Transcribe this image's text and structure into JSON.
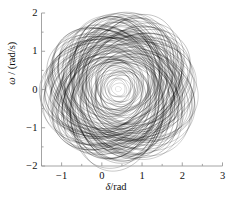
{
  "chart_data": {
    "type": "line",
    "title": "",
    "subtitle": "",
    "xlabel": "δ/rad",
    "ylabel": "ω / (rad/s)",
    "xlabel_symbol": "δ",
    "xlabel_unit": "/rad",
    "ylabel_symbol": "ω",
    "ylabel_unit": " / (rad/s)",
    "xlim": [
      -1.5,
      3.0
    ],
    "ylim": [
      -2.0,
      2.0
    ],
    "xticks": [
      -1,
      0,
      1,
      2,
      3
    ],
    "xtick_labels": [
      "-1",
      "0",
      "1",
      "2",
      "3"
    ],
    "yticks": [
      -2,
      -1,
      0,
      1,
      2
    ],
    "ytick_labels": [
      "-2",
      "-1",
      "0",
      "1",
      "2"
    ],
    "x_minor_tick_step": 0.5,
    "y_minor_tick_step": 0.5,
    "grid": false,
    "legend": null,
    "legend_position": "none",
    "spines": [
      "left",
      "bottom"
    ],
    "line_color": "#000000",
    "background_color": "#ffffff",
    "axis_color": "#9a9a9a",
    "attractor": {
      "center_x": 0.42,
      "center_y": 0.02,
      "x_extent": [
        -1.42,
        2.52
      ],
      "y_extent": [
        -1.78,
        1.82
      ],
      "orbit_count": 96,
      "inner_radius_x": 0.07,
      "inner_radius_y": 0.07,
      "outer_radius_x": 1.62,
      "outer_radius_y": 1.74,
      "shape": "rounded-triangular",
      "triangular_harmonic": 0.12,
      "rotation_deg": -16
    },
    "series": [
      {
        "name": "trajectory",
        "color": "#000000",
        "linewidth": 0.35,
        "points_note": "orbits generated parametrically from attractor parameters"
      }
    ]
  }
}
